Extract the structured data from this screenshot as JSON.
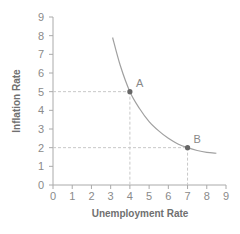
{
  "chart_data": {
    "type": "line",
    "title": "",
    "xlabel": "Unemployment Rate",
    "ylabel": "Inflation Rate",
    "xlim": [
      0,
      9
    ],
    "ylim": [
      0,
      9
    ],
    "x_ticks": [
      "0",
      "1",
      "2",
      "3",
      "4",
      "5",
      "6",
      "7",
      "8",
      "9"
    ],
    "y_ticks": [
      "0",
      "1",
      "2",
      "3",
      "4",
      "5",
      "6",
      "7",
      "8",
      "9"
    ],
    "grid": false,
    "legend": null,
    "series": [
      {
        "name": "Phillips Curve",
        "x": [
          3.1,
          3.5,
          4.0,
          4.5,
          5.0,
          5.5,
          6.0,
          6.5,
          7.0,
          7.5,
          8.0,
          8.5
        ],
        "values": [
          7.9,
          6.4,
          5.0,
          4.1,
          3.4,
          2.9,
          2.5,
          2.2,
          2.0,
          1.85,
          1.75,
          1.7
        ]
      }
    ],
    "points": [
      {
        "label": "A",
        "x": 4,
        "y": 5
      },
      {
        "label": "B",
        "x": 7,
        "y": 2
      }
    ],
    "colors": {
      "curve": "#a0a0a0",
      "point": "#666666",
      "guide": "#c8c8c8",
      "axis": "#aaaaaa"
    }
  }
}
